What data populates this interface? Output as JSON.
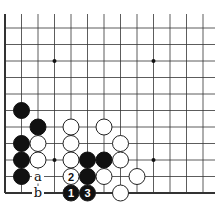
{
  "diagram": {
    "type": "go-board-fragment",
    "grid": {
      "origin_x": 5,
      "origin_y": 193,
      "spacing": 16.5,
      "cols": 13,
      "rows": 12
    },
    "star_points": [
      [
        3,
        2
      ],
      [
        9,
        2
      ],
      [
        3,
        8
      ],
      [
        9,
        8
      ]
    ],
    "black_stones": [
      [
        1,
        5
      ],
      [
        2,
        4
      ],
      [
        1,
        3
      ],
      [
        1,
        2
      ],
      [
        1,
        1
      ],
      [
        5,
        2
      ],
      [
        6,
        2
      ],
      [
        5,
        1
      ]
    ],
    "white_stones": [
      [
        2,
        3
      ],
      [
        2,
        2
      ],
      [
        4,
        4
      ],
      [
        4,
        3
      ],
      [
        4,
        2
      ],
      [
        6,
        4
      ],
      [
        7,
        3
      ],
      [
        7,
        2
      ],
      [
        6,
        1
      ],
      [
        8,
        1
      ],
      [
        7,
        0
      ]
    ],
    "numbered_moves": [
      {
        "n": "1",
        "color": "black",
        "pos": [
          4,
          0
        ]
      },
      {
        "n": "2",
        "color": "white",
        "pos": [
          4,
          1
        ]
      },
      {
        "n": "3",
        "color": "black",
        "pos": [
          5,
          0
        ]
      }
    ],
    "labels": [
      {
        "text": "a",
        "pos": [
          2,
          1
        ]
      },
      {
        "text": "b",
        "pos": [
          2,
          0
        ]
      }
    ]
  }
}
